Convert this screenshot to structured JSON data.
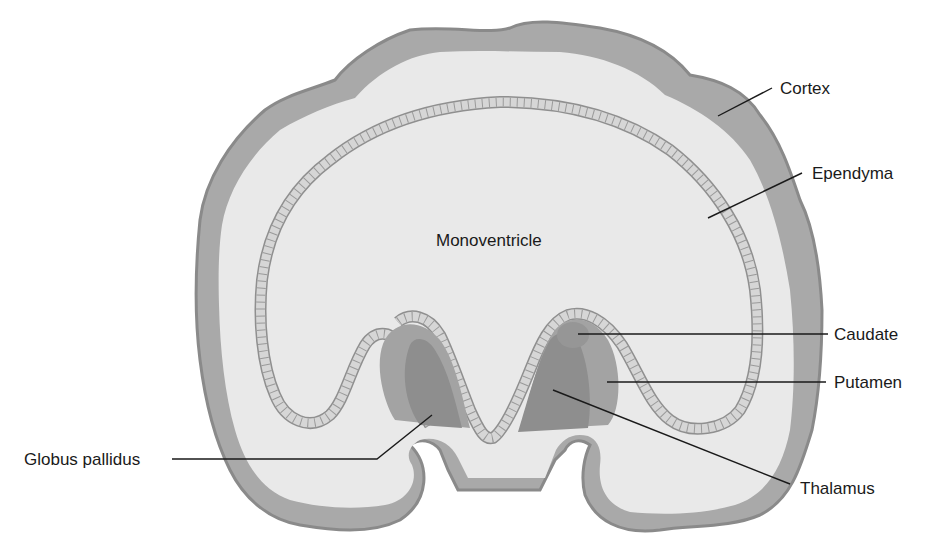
{
  "diagram": {
    "colors": {
      "cortex": "#a9a9a9",
      "cortex_edge": "#8a8a8a",
      "white_matter": "#e9e9e9",
      "ependyma_fill": "#d6d6d6",
      "ependyma_edge": "#8f8f8f",
      "putamen": "#a3a3a3",
      "thalamus": "#8e8e8e",
      "caudate": "#969696",
      "ventricle": "#ebebeb",
      "background": "#ffffff",
      "text": "#1a1a1a"
    },
    "center_label": "Monoventricle",
    "labels": {
      "cortex": "Cortex",
      "ependyma": "Ependyma",
      "caudate": "Caudate",
      "putamen": "Putamen",
      "thalamus": "Thalamus",
      "globus_pallidus": "Globus pallidus"
    }
  }
}
